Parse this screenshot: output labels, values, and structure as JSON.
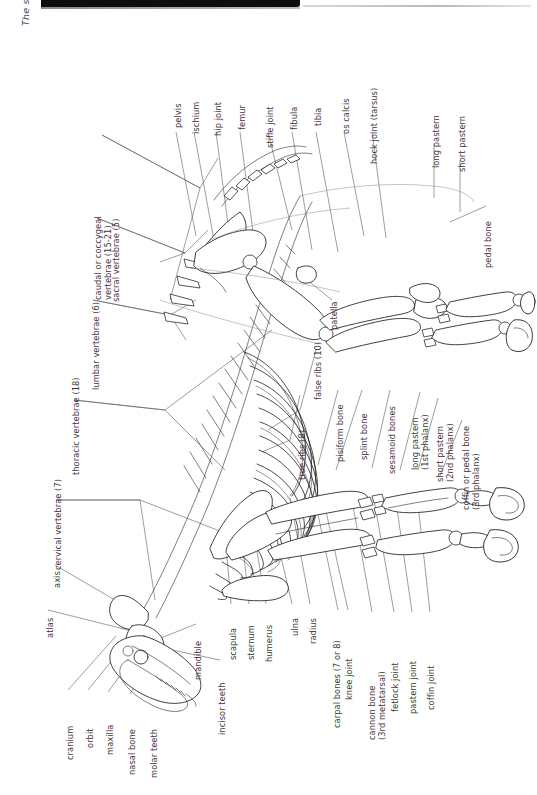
{
  "page": {
    "caption": "The skeleton.",
    "background_color": "#ffffff",
    "ink_color": "#1f1f1f",
    "label_color": "#3a3a3a",
    "orientation": "rotated 90 degrees counter-clockwise"
  },
  "labels": {
    "caudal_vertebrae": "caudal or coccygeal\nvertebrae (15-21)",
    "sacral_vertebrae": "sacral vertebrae (5)",
    "lumbar_vertebrae": "lumbar vertebrae (6)",
    "thoracic_vertebrae": "thoracic vertebrae (18)",
    "cervical_vertebrae": "cervical vertebrae (7)",
    "axis": "axis",
    "atlas": "atlas",
    "cranium": "cranium",
    "orbit": "orbit",
    "maxilla": "maxilla",
    "nasal_bone": "nasal bone",
    "molar_teeth": "molar teeth",
    "mandible": "mandible",
    "incisor_teeth": "incisor teeth",
    "scapula": "scapula",
    "sternum": "sternum",
    "humerus": "humerus",
    "ulna": "ulna",
    "radius": "radius",
    "carpal_bones": "carpal bones (7 or 8)",
    "knee_joint": "knee joint",
    "cannon_bone": "cannon bone\n(3rd metatarsal)",
    "fetlock_joint": "fetlock joint",
    "pastern_joint": "pastern joint",
    "coffin_joint": "coffin joint",
    "true_ribs": "true ribs (8)",
    "false_ribs": "false ribs (10)",
    "pisiform_bone": "pisiform bone",
    "splint_bone": "splint bone",
    "sesamoid_bones": "sesamoid bones",
    "long_pastern_1st": "long pastern\n(1st phalanx)",
    "short_pastern_2nd": "short pastern\n(2nd phalanx)",
    "coffin_pedal_bone": "coffin or pedal bone\n(3rd phalanx)",
    "patella": "patella",
    "pelvis": "pelvis",
    "ischium": "ischium",
    "hip_joint": "hip joint",
    "femur": "femur",
    "stifle_joint": "stifle joint",
    "fibula": "fibula",
    "tibia": "tibia",
    "os_calcis": "os calcis",
    "hock_joint": "hock joint (tarsus)",
    "long_pastern": "long pastern",
    "short_pastern": "short pastern",
    "pedal_bone": "pedal bone"
  }
}
